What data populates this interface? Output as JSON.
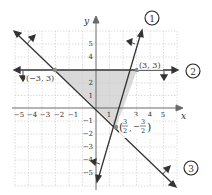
{
  "axes": {
    "x_label": "x",
    "y_label": "y",
    "x_ticks": [
      "−5",
      "−4",
      "−3",
      "−2",
      "−1",
      "1",
      "3",
      "4",
      "5"
    ],
    "x_tick_values": [
      -5,
      -4,
      -3,
      -2,
      -1,
      1,
      3,
      4,
      5
    ],
    "y_ticks": [
      "5",
      "4",
      "2",
      "1",
      "−1",
      "−2",
      "−3",
      "−4",
      "−5"
    ],
    "y_tick_values": [
      5,
      4,
      2,
      1,
      -1,
      -2,
      -3,
      -4,
      -5
    ],
    "range": {
      "x": [
        -6,
        6
      ],
      "y": [
        -6,
        6
      ]
    }
  },
  "boundaries": [
    {
      "id": "1",
      "label": "1",
      "equation": "y = 3x - 6",
      "shade_arrow": "up-left"
    },
    {
      "id": "2",
      "label": "2",
      "equation": "y = 3",
      "shade_arrow": "down"
    },
    {
      "id": "3",
      "label": "3",
      "equation": "y = -x",
      "shade_arrow": "up-right"
    }
  ],
  "vertices": [
    {
      "label": "(−3, 3)",
      "x": -3,
      "y": 3
    },
    {
      "label": "(3, 3)",
      "x": 3,
      "y": 3
    },
    {
      "label_num1": "3",
      "label_den1": "2",
      "label_num2": "3",
      "label_den2": "2",
      "x": 1.5,
      "y": -1.5
    }
  ],
  "colors": {
    "grid": "#cfcfcf",
    "axis": "#6a6a6a",
    "line": "#333333",
    "region": "#d9d9d9",
    "vertex": "#8a8a8a"
  }
}
